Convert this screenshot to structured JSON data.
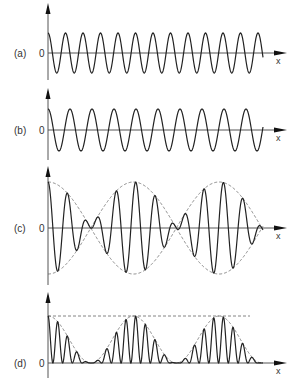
{
  "figure": {
    "panels": [
      {
        "id": "a",
        "label": "(a)",
        "zero_label": "0",
        "axis_label": "x",
        "type": "wave",
        "period": 17.5,
        "amplitude": 20,
        "baseline": 53,
        "axis_top": 3,
        "axis_bottom": 80
      },
      {
        "id": "b",
        "label": "(b)",
        "zero_label": "0",
        "axis_label": "x",
        "type": "wave",
        "period": 22,
        "amplitude": 21,
        "baseline": 130,
        "axis_top": 88,
        "axis_bottom": 160
      },
      {
        "id": "c",
        "label": "(c)",
        "zero_label": "0",
        "axis_label": "x",
        "type": "sum",
        "amplitude": 46,
        "baseline": 228,
        "axis_top": 166,
        "axis_bottom": 285,
        "envelope": "dashed"
      },
      {
        "id": "d",
        "label": "(d)",
        "zero_label": "0",
        "axis_label": "x",
        "type": "intensity",
        "amplitude": 47,
        "baseline": 363,
        "axis_top": 292,
        "axis_bottom": 378,
        "envelope": "dashed",
        "max_line": "dashed"
      }
    ],
    "x_start": 48,
    "x_end": 263,
    "axis_end": 287,
    "colors": {
      "curve": "#222222",
      "axis": "#555555",
      "dashed": "#666666"
    }
  }
}
